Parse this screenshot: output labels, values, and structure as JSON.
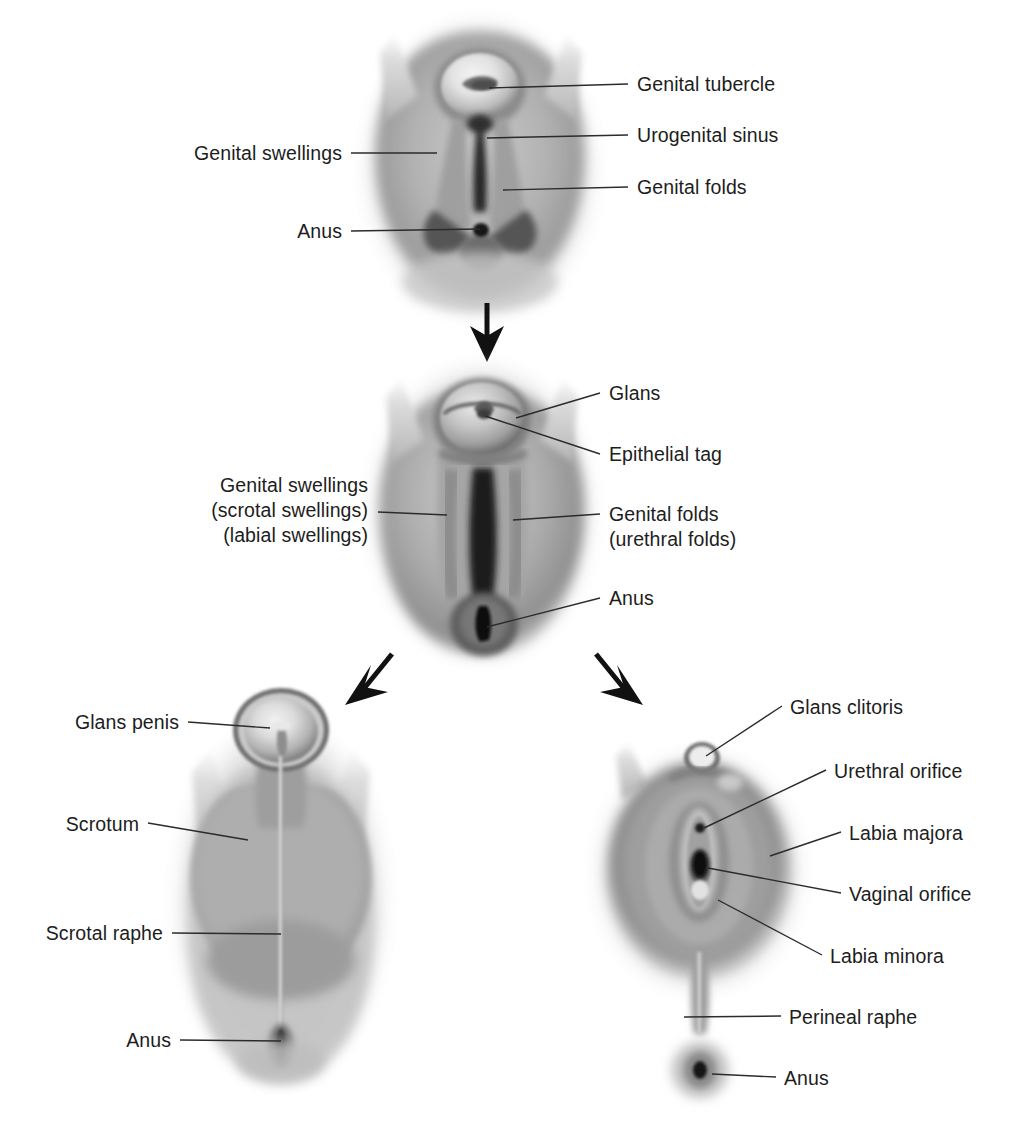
{
  "figure": {
    "stages": [
      {
        "id": "indifferent-stage",
        "name": "Indifferent stage external genitalia",
        "labels": [
          {
            "id": "genital-tubercle",
            "text": "Genital tubercle",
            "side": "right"
          },
          {
            "id": "urogenital-sinus",
            "text": "Urogenital sinus",
            "side": "right"
          },
          {
            "id": "genital-folds",
            "text": "Genital folds",
            "side": "right"
          },
          {
            "id": "genital-swellings",
            "text": "Genital swellings",
            "side": "left"
          },
          {
            "id": "anus",
            "text": "Anus",
            "side": "left"
          }
        ]
      },
      {
        "id": "intermediate-stage",
        "name": "Intermediate stage external genitalia",
        "labels": [
          {
            "id": "glans",
            "text": "Glans",
            "side": "right"
          },
          {
            "id": "epithelial-tag",
            "text": "Epithelial tag",
            "side": "right"
          },
          {
            "id": "genital-folds-urethral",
            "text": "Genital folds",
            "text2": "(urethral folds)",
            "side": "right"
          },
          {
            "id": "anus-mid",
            "text": "Anus",
            "side": "right"
          },
          {
            "id": "genital-swellings-mid",
            "text": "Genital swellings",
            "text2": "(scrotal swellings)",
            "text3": "(labial swellings)",
            "side": "left"
          }
        ]
      },
      {
        "id": "male-stage",
        "name": "Male external genitalia",
        "labels": [
          {
            "id": "glans-penis",
            "text": "Glans penis",
            "side": "left"
          },
          {
            "id": "scrotum",
            "text": "Scrotum",
            "side": "left"
          },
          {
            "id": "scrotal-raphe",
            "text": "Scrotal raphe",
            "side": "left"
          },
          {
            "id": "anus-male",
            "text": "Anus",
            "side": "left"
          }
        ]
      },
      {
        "id": "female-stage",
        "name": "Female external genitalia",
        "labels": [
          {
            "id": "glans-clitoris",
            "text": "Glans clitoris",
            "side": "right"
          },
          {
            "id": "urethral-orifice",
            "text": "Urethral orifice",
            "side": "right"
          },
          {
            "id": "labia-majora",
            "text": "Labia majora",
            "side": "right"
          },
          {
            "id": "vaginal-orifice",
            "text": "Vaginal orifice",
            "side": "right"
          },
          {
            "id": "labia-minora",
            "text": "Labia minora",
            "side": "right"
          },
          {
            "id": "perineal-raphe",
            "text": "Perineal raphe",
            "side": "right"
          },
          {
            "id": "anus-female",
            "text": "Anus",
            "side": "right"
          }
        ]
      }
    ],
    "arrows": [
      {
        "id": "arrow-down",
        "direction": "down"
      },
      {
        "id": "arrow-down-left",
        "direction": "down-left"
      },
      {
        "id": "arrow-down-right",
        "direction": "down-right"
      }
    ],
    "colors": {
      "text": "#1d1d1d",
      "leader_line": "#2b2b2b",
      "arrow": "#111111",
      "background": "#ffffff",
      "tissue_light": "#d8d8d8",
      "tissue_mid": "#9a9a9a",
      "tissue_dark": "#4a4a4a",
      "tissue_shadow": "#2a2a2a"
    },
    "labels_text": {
      "genital_tubercle": "Genital tubercle",
      "urogenital_sinus": "Urogenital sinus",
      "genital_folds": "Genital folds",
      "genital_swellings": "Genital swellings",
      "anus_top": "Anus",
      "glans": "Glans",
      "epithelial_tag": "Epithelial tag",
      "genital_folds_mid_1": "Genital folds",
      "genital_folds_mid_2": "(urethral folds)",
      "anus_mid": "Anus",
      "genital_swellings_mid_1": "Genital swellings",
      "genital_swellings_mid_2": "(scrotal swellings)",
      "genital_swellings_mid_3": "(labial swellings)",
      "glans_penis": "Glans penis",
      "scrotum": "Scrotum",
      "scrotal_raphe": "Scrotal raphe",
      "anus_male": "Anus",
      "glans_clitoris": "Glans clitoris",
      "urethral_orifice": "Urethral orifice",
      "labia_majora": "Labia majora",
      "vaginal_orifice": "Vaginal orifice",
      "labia_minora": "Labia minora",
      "perineal_raphe": "Perineal raphe",
      "anus_female": "Anus"
    }
  }
}
